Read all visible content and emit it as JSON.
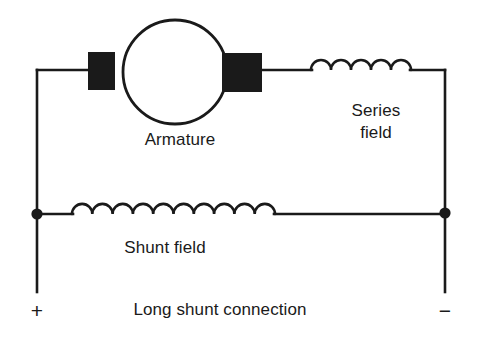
{
  "diagram": {
    "title": "Long shunt connection",
    "type": "dc-compound-machine-circuit",
    "background_color": "#ffffff",
    "line_color": "#1a1a1a",
    "labels": {
      "armature": "Armature",
      "series_field_line1": "Series",
      "series_field_line2": "field",
      "shunt_field": "Shunt field",
      "caption": "Long shunt connection"
    },
    "terminals": {
      "positive": "+",
      "negative": "−"
    },
    "components": {
      "armature": {
        "name": "Armature",
        "shape": "circle",
        "cx": 175,
        "cy": 72,
        "r": 52,
        "stroke_width": 2.6
      },
      "brush_left": {
        "name": "Left brush",
        "shape": "filled-rect",
        "x": 88,
        "y": 52,
        "width": 27,
        "height": 38
      },
      "brush_right": {
        "name": "Right brush",
        "shape": "filled-rect",
        "x": 222,
        "y": 53,
        "width": 40,
        "height": 39
      },
      "series_field_coil": {
        "name": "Series field",
        "shape": "coil",
        "arcs": 5,
        "x_start": 311,
        "x_end": 411,
        "y": 70,
        "arc_radius": 10,
        "stroke_width": 2.6
      },
      "shunt_field_coil": {
        "name": "Shunt field",
        "shape": "coil",
        "arcs": 10,
        "x_start": 72,
        "x_end": 275,
        "y": 214,
        "arc_radius": 10.15,
        "stroke_width": 2.6
      },
      "node_left": {
        "name": "Left junction node",
        "shape": "filled-circle",
        "cx": 37,
        "cy": 214,
        "r": 5.5
      },
      "node_right": {
        "name": "Right junction node",
        "shape": "filled-circle",
        "cx": 445,
        "cy": 213,
        "r": 5.5
      }
    },
    "wires": {
      "top_left_segment": "M37,70 L88,70",
      "top_right_segment": "M262,70 L311,70",
      "series_to_corner": "M411,70 L445,70",
      "left_vertical": "M37,70 L37,292",
      "right_vertical": "M445,70 L445,292",
      "shunt_left_lead": "M37,214 L72,214",
      "shunt_right_lead": "M275,214 L445,214"
    }
  }
}
